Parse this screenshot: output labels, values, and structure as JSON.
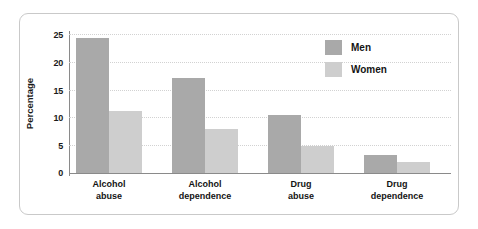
{
  "chart_data": {
    "type": "bar",
    "title": "",
    "xlabel": "",
    "ylabel": "Percentage",
    "ylim": [
      0,
      25
    ],
    "yticks": [
      "0",
      "5",
      "10",
      "15",
      "20",
      "25"
    ],
    "grid": true,
    "legend_position": "top-right",
    "categories": [
      {
        "line1": "Alcohol",
        "line2": "abuse"
      },
      {
        "line1": "Alcohol",
        "line2": "dependence"
      },
      {
        "line1": "Drug",
        "line2": "abuse"
      },
      {
        "line1": "Drug",
        "line2": "dependence"
      }
    ],
    "series": [
      {
        "name": "Men",
        "color": "#a9a9a9",
        "values": [
          24.3,
          17.0,
          10.4,
          3.2
        ]
      },
      {
        "name": "Women",
        "color": "#cecece",
        "values": [
          11.2,
          7.9,
          4.9,
          1.9
        ]
      }
    ]
  }
}
